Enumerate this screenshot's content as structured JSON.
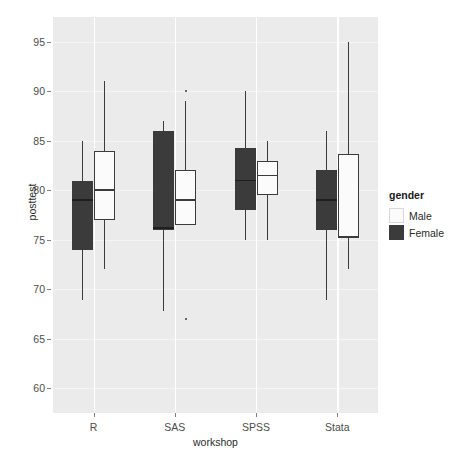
{
  "chart_data": {
    "type": "box",
    "title": "",
    "xlabel": "workshop",
    "ylabel": "posttest",
    "categories": [
      "R",
      "SAS",
      "SPSS",
      "Stata"
    ],
    "ylim": [
      57.5,
      97.5
    ],
    "yticks": [
      60,
      65,
      70,
      75,
      80,
      85,
      90,
      95
    ],
    "grid": true,
    "legend": {
      "title": "gender",
      "position": "right",
      "entries": [
        {
          "name": "Male",
          "color": "#fbfbfb"
        },
        {
          "name": "Female",
          "color": "#3b3b3b"
        }
      ]
    },
    "series": [
      {
        "name": "Female",
        "color": "#3b3b3b",
        "boxes": [
          {
            "category": "R",
            "min": 68.9,
            "q1": 74.0,
            "median": 79.0,
            "q3": 80.9,
            "max": 85.0,
            "outliers": []
          },
          {
            "category": "SAS",
            "min": 67.8,
            "q1": 76.0,
            "median": 76.2,
            "q3": 86.0,
            "max": 87.0,
            "outliers": []
          },
          {
            "category": "SPSS",
            "min": 75.0,
            "q1": 78.0,
            "median": 81.0,
            "q3": 84.3,
            "max": 90.0,
            "outliers": []
          },
          {
            "category": "Stata",
            "min": 68.9,
            "q1": 76.0,
            "median": 79.0,
            "q3": 82.0,
            "max": 86.0,
            "outliers": []
          }
        ]
      },
      {
        "name": "Male",
        "color": "#fbfbfb",
        "boxes": [
          {
            "category": "R",
            "min": 72.0,
            "q1": 77.0,
            "median": 80.0,
            "q3": 84.0,
            "max": 91.0,
            "outliers": []
          },
          {
            "category": "SAS",
            "min": 76.5,
            "q1": 76.5,
            "median": 79.0,
            "q3": 82.0,
            "max": 89.0,
            "outliers": [
              90.0,
              67.0
            ]
          },
          {
            "category": "SPSS",
            "min": 75.0,
            "q1": 79.5,
            "median": 81.5,
            "q3": 83.0,
            "max": 85.0,
            "outliers": []
          },
          {
            "category": "Stata",
            "min": 72.0,
            "q1": 75.2,
            "median": 75.3,
            "q3": 83.7,
            "max": 95.0,
            "outliers": []
          }
        ]
      }
    ]
  },
  "axis": {
    "ylabel": "posttest",
    "xlabel": "workshop",
    "ytick_labels": [
      "95",
      "90",
      "85",
      "80",
      "75",
      "70",
      "65",
      "60"
    ],
    "xtick_labels": [
      "R",
      "SAS",
      "SPSS",
      "Stata"
    ]
  },
  "legend": {
    "title": "gender",
    "male_label": "Male",
    "female_label": "Female"
  },
  "caption": {
    "text": ""
  },
  "colors": {
    "panel_background": "#ebebeb",
    "gridline": "#ffffff",
    "female_fill": "#3b3b3b",
    "male_fill": "#fbfbfb",
    "stroke": "#3b3b3b",
    "axis_text": "#4d4d4d"
  }
}
